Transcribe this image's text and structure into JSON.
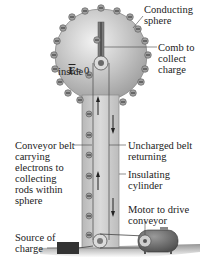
{
  "labels": {
    "conducting_sphere": "Conducting\nsphere",
    "comb": "Comb to\ncollect\ncharge",
    "e_field": "E = 0",
    "e_field_vec": "E",
    "e_field_eq": "= 0",
    "inside": "inside",
    "conveyor_belt": "Conveyor belt\ncarrying\nelectrons to\ncollecting\nrods within\nsphere",
    "uncharged_belt": "Uncharged belt\nreturning",
    "insulating_cylinder": "Insulating\ncylinder",
    "motor": "Motor to drive\nconveyor",
    "source": "Source of\ncharge"
  },
  "charge_symbol": "−",
  "colors": {
    "sphere": "#bdbdbd",
    "sphere_highlight": "#e8e8e8",
    "cylinder": "#c8c8c8",
    "belt_line": "#555555",
    "charge_fill": "#9a9a9a",
    "motor": "#6b6b6b",
    "source": "#3a3a3a",
    "ground": "#8a8a8a",
    "leader": "#444444",
    "text": "#222222"
  }
}
